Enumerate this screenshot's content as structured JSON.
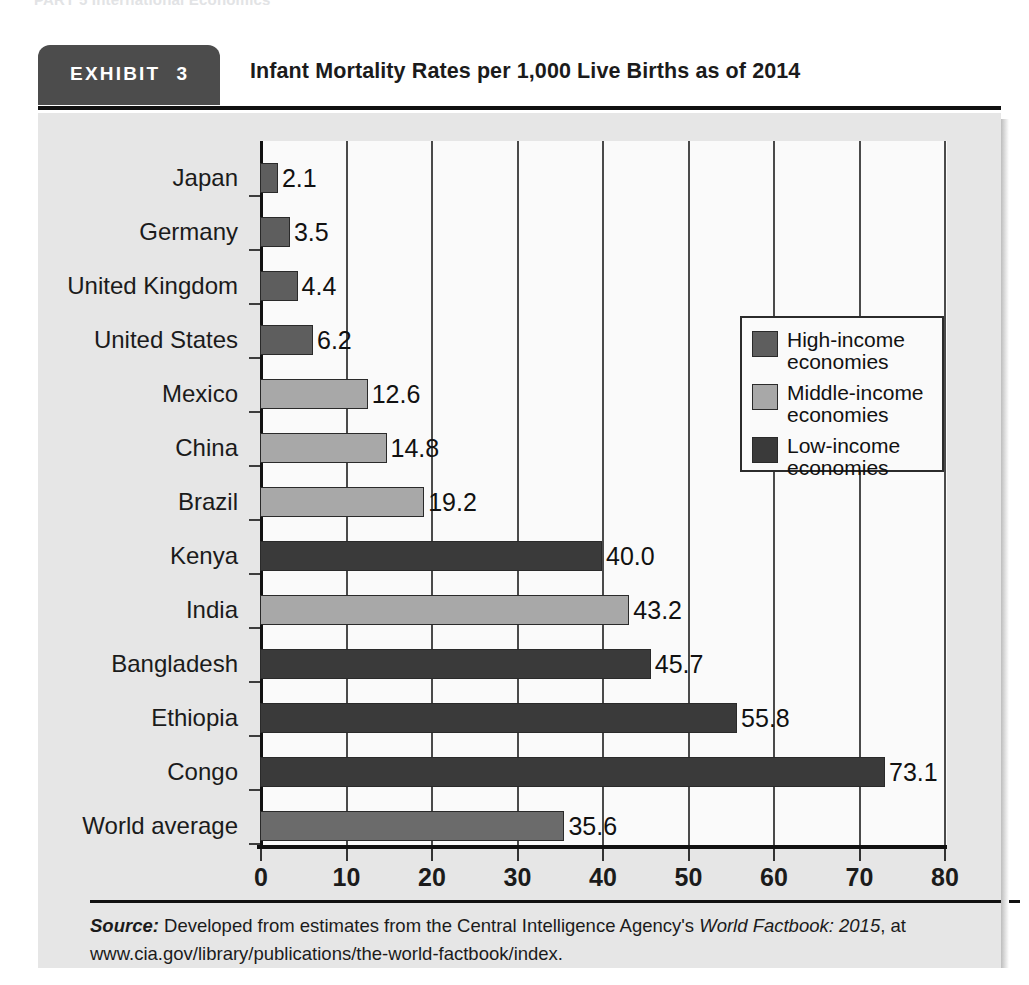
{
  "running_head": "PART 5   International Economics",
  "exhibit": {
    "badge_label": "EXHIBIT",
    "badge_number": "3",
    "title": "Infant Mortality Rates per 1,000 Live Births as of 2014"
  },
  "source": {
    "label": "Source:",
    "text_before_italic": " Developed from estimates from the Central Intelligence Agency's ",
    "italic_text": "World Factbook: 2015",
    "text_after_italic": ", at www.cia.gov/library/publications/the-world-factbook/index."
  },
  "legend": {
    "position": "top-right-inside",
    "items": [
      {
        "label_line1": "High-income",
        "label_line2": "economies",
        "color": "#5e5e5e",
        "key": "high"
      },
      {
        "label_line1": "Middle-income",
        "label_line2": "economies",
        "color": "#a8a8a8",
        "key": "middle"
      },
      {
        "label_line1": "Low-income",
        "label_line2": "economies",
        "color": "#3a3a3a",
        "key": "low"
      }
    ]
  },
  "chart_data": {
    "type": "bar",
    "orientation": "horizontal",
    "title": "Infant Mortality Rates per 1,000 Live Births as of 2014",
    "xlabel": "",
    "ylabel": "",
    "xlim": [
      0,
      80
    ],
    "xticks": [
      0,
      10,
      20,
      30,
      40,
      50,
      60,
      70,
      80
    ],
    "xtick_labels": [
      "0",
      "10",
      "20",
      "30",
      "40",
      "50",
      "60",
      "70",
      "80"
    ],
    "grid": "vertical",
    "categories": [
      "Japan",
      "Germany",
      "United Kingdom",
      "United States",
      "Mexico",
      "China",
      "Brazil",
      "Kenya",
      "India",
      "Bangladesh",
      "Ethiopia",
      "Congo",
      "World average"
    ],
    "values": [
      2.1,
      3.5,
      4.4,
      6.2,
      12.6,
      14.8,
      19.2,
      40.0,
      43.2,
      45.7,
      55.8,
      73.1,
      35.6
    ],
    "value_labels": [
      "2.1",
      "3.5",
      "4.4",
      "6.2",
      "12.6",
      "14.8",
      "19.2",
      "40.0",
      "43.2",
      "45.7",
      "55.8",
      "73.1",
      "35.6"
    ],
    "groups": [
      "high",
      "high",
      "high",
      "high",
      "middle",
      "middle",
      "middle",
      "low",
      "middle",
      "low",
      "low",
      "low",
      "world"
    ],
    "group_colors": {
      "high": "#5e5e5e",
      "middle": "#a8a8a8",
      "low": "#3a3a3a",
      "world": "#6b6b6b"
    }
  }
}
